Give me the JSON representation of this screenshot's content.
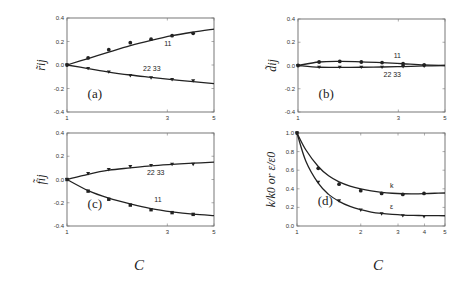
{
  "chart_data": [
    {
      "id": "a",
      "type": "line",
      "panel_label": "(a)",
      "ylabel": "r̃ij",
      "xlabel": "C",
      "x_scale": "log",
      "xlim": [
        1,
        5
      ],
      "ylim": [
        -0.4,
        0.4
      ],
      "xticks": [
        1,
        3,
        5
      ],
      "yticks": [
        -0.4,
        -0.2,
        0.0,
        0.2,
        0.4
      ],
      "ytick_labels": [
        "-0.4",
        "-0.2",
        "0.0",
        "0.2",
        "0.4"
      ],
      "frame": {
        "x": 67,
        "y": 18,
        "w": 147,
        "h": 94
      },
      "panel_label_pos": [
        0.14,
        0.8
      ],
      "series": [
        {
          "name": "11",
          "marker": "circle",
          "label_pos": [
            2.9,
            0.16
          ],
          "x": [
            1,
            1.26,
            1.58,
            2.0,
            2.51,
            3.16,
            3.98
          ],
          "values": [
            0.0,
            0.06,
            0.13,
            0.19,
            0.22,
            0.25,
            0.27
          ],
          "fit_x": [
            1,
            1.26,
            1.58,
            2.0,
            2.51,
            3.16,
            3.98,
            5
          ],
          "fit": [
            0.0,
            0.055,
            0.11,
            0.165,
            0.21,
            0.25,
            0.28,
            0.305
          ]
        },
        {
          "name": "22  33",
          "marker": "triangle",
          "label_pos": [
            2.3,
            -0.055
          ],
          "x": [
            1,
            1.26,
            1.58,
            2.0,
            2.51,
            3.16,
            3.98
          ],
          "values": [
            0.0,
            -0.03,
            -0.06,
            -0.09,
            -0.11,
            -0.125,
            -0.135
          ],
          "fit_x": [
            1,
            1.26,
            1.58,
            2.0,
            2.51,
            3.16,
            3.98,
            5
          ],
          "fit": [
            0.0,
            -0.03,
            -0.06,
            -0.085,
            -0.105,
            -0.125,
            -0.142,
            -0.158
          ]
        }
      ]
    },
    {
      "id": "b",
      "type": "line",
      "panel_label": "(b)",
      "ylabel": "d̃ij",
      "xlabel": "C",
      "x_scale": "log",
      "xlim": [
        1,
        5
      ],
      "ylim": [
        -0.4,
        0.4
      ],
      "xticks": [
        1,
        3,
        5
      ],
      "yticks": [
        -0.4,
        -0.2,
        0.0,
        0.2,
        0.4
      ],
      "ytick_labels": [
        "-0.4",
        "-0.2",
        "0.0",
        "0.2",
        "0.4"
      ],
      "frame": {
        "x": 298,
        "y": 19,
        "w": 147,
        "h": 93
      },
      "panel_label_pos": [
        0.14,
        0.8
      ],
      "series": [
        {
          "name": "11",
          "marker": "circle",
          "label_pos": [
            2.85,
            0.065
          ],
          "x": [
            1,
            1.26,
            1.58,
            2.0,
            2.51,
            3.16,
            3.98
          ],
          "values": [
            0.0,
            0.03,
            0.035,
            0.03,
            0.025,
            0.015,
            0.005
          ],
          "fit_x": [
            1,
            1.26,
            1.58,
            2.0,
            2.51,
            3.16,
            3.98,
            5
          ],
          "fit": [
            0.0,
            0.03,
            0.035,
            0.032,
            0.025,
            0.015,
            0.005,
            0.0
          ]
        },
        {
          "name": "22  33",
          "marker": "triangle",
          "label_pos": [
            2.55,
            -0.095
          ],
          "x": [
            1,
            1.26,
            1.58,
            2.0,
            2.51,
            3.16,
            3.98
          ],
          "values": [
            0.0,
            -0.015,
            -0.015,
            -0.015,
            -0.015,
            -0.01,
            -0.005
          ],
          "fit_x": [
            1,
            1.26,
            1.58,
            2.0,
            2.51,
            3.16,
            3.98,
            5
          ],
          "fit": [
            0.0,
            -0.015,
            -0.016,
            -0.015,
            -0.013,
            -0.009,
            -0.004,
            0.0
          ]
        }
      ]
    },
    {
      "id": "c",
      "type": "line",
      "panel_label": "(c)",
      "ylabel": "f̃ij",
      "xlabel": "C",
      "x_scale": "log",
      "xlim": [
        1,
        5
      ],
      "ylim": [
        -0.4,
        0.4
      ],
      "xticks": [
        1,
        3,
        5
      ],
      "yticks": [
        -0.4,
        -0.2,
        0.0,
        0.2,
        0.4
      ],
      "ytick_labels": [
        "-0.4",
        "-0.2",
        "0.0",
        "0.2",
        "0.4"
      ],
      "frame": {
        "x": 67,
        "y": 133,
        "w": 147,
        "h": 93
      },
      "panel_label_pos": [
        0.14,
        0.75
      ],
      "series": [
        {
          "name": "22  33",
          "marker": "triangle",
          "label_pos": [
            2.4,
            0.04
          ],
          "x": [
            1,
            1.26,
            1.58,
            2.0,
            2.51,
            3.16,
            3.98
          ],
          "values": [
            0.0,
            0.05,
            0.085,
            0.11,
            0.12,
            0.13,
            0.13
          ],
          "fit_x": [
            1,
            1.26,
            1.58,
            2.0,
            2.51,
            3.16,
            3.98,
            5
          ],
          "fit": [
            0.0,
            0.045,
            0.08,
            0.1,
            0.118,
            0.13,
            0.14,
            0.15
          ]
        },
        {
          "name": "11",
          "marker": "square",
          "label_pos": [
            2.6,
            -0.19
          ],
          "x": [
            1,
            1.26,
            1.58,
            2.0,
            2.51,
            3.16,
            3.98
          ],
          "values": [
            0.0,
            -0.1,
            -0.17,
            -0.22,
            -0.26,
            -0.285,
            -0.3
          ],
          "fit_x": [
            1,
            1.26,
            1.58,
            2.0,
            2.51,
            3.16,
            3.98,
            5
          ],
          "fit": [
            0.0,
            -0.095,
            -0.16,
            -0.21,
            -0.25,
            -0.278,
            -0.298,
            -0.31
          ]
        }
      ]
    },
    {
      "id": "d",
      "type": "line",
      "panel_label": "(d)",
      "ylabel": "k/k0  or  ε/ε0",
      "xlabel": "C",
      "x_scale": "log",
      "xlim": [
        1,
        5
      ],
      "ylim": [
        0.0,
        1.0
      ],
      "xticks": [
        1,
        2,
        3,
        4,
        5
      ],
      "yticks": [
        0.0,
        0.2,
        0.4,
        0.6,
        0.8,
        1.0
      ],
      "ytick_labels": [
        "0.0",
        "0.2",
        "0.4",
        "0.6",
        "0.8",
        "1.0"
      ],
      "frame": {
        "x": 297,
        "y": 133,
        "w": 148,
        "h": 93
      },
      "panel_label_pos": [
        0.14,
        0.72
      ],
      "series": [
        {
          "name": "k",
          "marker": "circle",
          "label_pos": [
            2.75,
            0.41
          ],
          "x": [
            1,
            1.26,
            1.58,
            2.0,
            2.51,
            3.16,
            3.98
          ],
          "values": [
            1.0,
            0.62,
            0.45,
            0.38,
            0.35,
            0.34,
            0.35
          ],
          "fit_x": [
            1,
            1.1,
            1.26,
            1.41,
            1.58,
            1.78,
            2.0,
            2.24,
            2.51,
            2.82,
            3.16,
            3.55,
            3.98,
            4.47,
            5
          ],
          "fit": [
            1.0,
            0.82,
            0.64,
            0.54,
            0.475,
            0.43,
            0.4,
            0.378,
            0.362,
            0.352,
            0.347,
            0.346,
            0.348,
            0.352,
            0.355
          ]
        },
        {
          "name": "ε",
          "marker": "triangle",
          "label_pos": [
            2.75,
            0.18
          ],
          "x": [
            1,
            1.26,
            1.58,
            2.0,
            2.51,
            3.16,
            3.98
          ],
          "values": [
            1.0,
            0.47,
            0.27,
            0.17,
            0.13,
            0.11,
            0.1
          ],
          "fit_x": [
            1,
            1.1,
            1.26,
            1.41,
            1.58,
            1.78,
            2.0,
            2.24,
            2.51,
            2.82,
            3.16,
            3.55,
            3.98,
            4.47,
            5
          ],
          "fit": [
            1.0,
            0.7,
            0.46,
            0.34,
            0.265,
            0.21,
            0.175,
            0.15,
            0.135,
            0.125,
            0.118,
            0.114,
            0.112,
            0.111,
            0.11
          ]
        }
      ]
    }
  ],
  "x_axis_titles": [
    {
      "text": "C",
      "x": 139,
      "y": 270
    },
    {
      "text": "C",
      "x": 378,
      "y": 270
    }
  ]
}
